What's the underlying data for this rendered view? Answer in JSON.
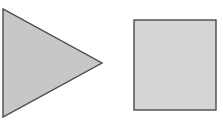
{
  "canvas": {
    "width": 223,
    "height": 124,
    "background_color": "#ffffff"
  },
  "shapes": [
    {
      "id": "triangle",
      "name": "right-pointing-triangle",
      "type": "polygon",
      "points": "3,9 3,117 102,63",
      "fill_color": "#c7c7c7",
      "stroke_color": "#4a4a4a",
      "stroke_width": 1.4,
      "label": ""
    },
    {
      "id": "square",
      "name": "square",
      "type": "rect",
      "x": 134,
      "y": 20,
      "width": 82,
      "height": 90,
      "fill_color": "#d5d5d5",
      "stroke_color": "#4a4a4a",
      "stroke_width": 1.4,
      "label": ""
    }
  ]
}
